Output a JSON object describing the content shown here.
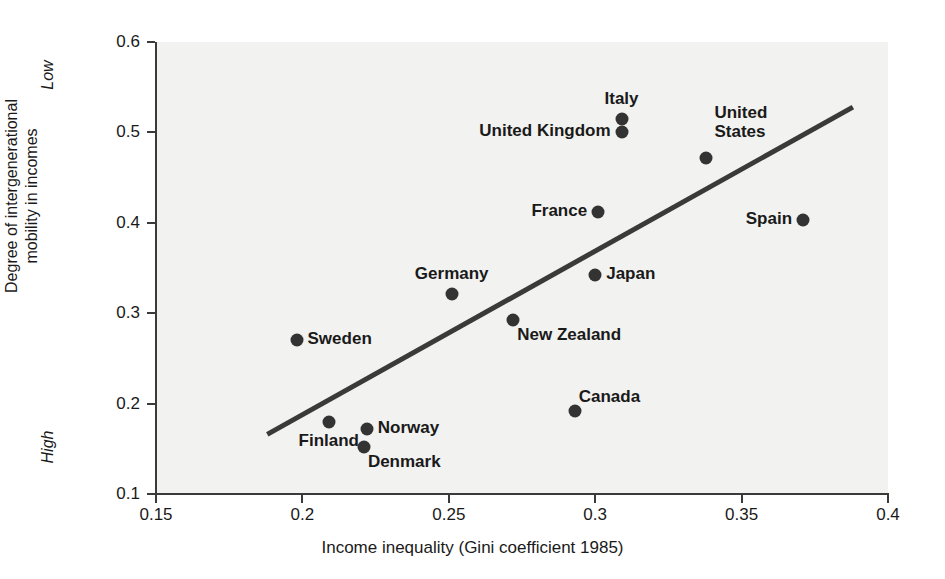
{
  "chart_data": {
    "type": "scatter",
    "title": "",
    "xlabel": "Income inequality (Gini coefficient 1985)",
    "ylabel": "Degree of intergenerational\nmobility in incomes",
    "ylabel_line1": "Degree of intergenerational",
    "ylabel_line2": "mobility in incomes",
    "xlim": [
      0.15,
      0.4
    ],
    "ylim": [
      0.1,
      0.6
    ],
    "xticks": [
      "0.15",
      "0.2",
      "0.25",
      "0.3",
      "0.35",
      "0.4"
    ],
    "xtick_values": [
      0.15,
      0.2,
      0.25,
      0.3,
      0.35,
      0.4
    ],
    "yticks": [
      "0.1",
      "0.2",
      "0.3",
      "0.4",
      "0.5",
      "0.6"
    ],
    "ytick_values": [
      0.1,
      0.2,
      0.3,
      0.4,
      0.5,
      0.6
    ],
    "grid": false,
    "legend": "none",
    "y_axis_annotations": [
      {
        "text": "Low",
        "value": 0.555,
        "name": "low-annotation"
      },
      {
        "text": "High",
        "value": 0.145,
        "name": "high-annotation"
      }
    ],
    "points": [
      {
        "label": "Sweden",
        "x": 0.198,
        "y": 0.27,
        "label_pos": "right"
      },
      {
        "label": "Finland",
        "x": 0.209,
        "y": 0.18,
        "label_pos": "below"
      },
      {
        "label": "Norway",
        "x": 0.222,
        "y": 0.172,
        "label_pos": "right"
      },
      {
        "label": "Denmark",
        "x": 0.221,
        "y": 0.152,
        "label_pos": "below-right"
      },
      {
        "label": "Germany",
        "x": 0.251,
        "y": 0.321,
        "label_pos": "above"
      },
      {
        "label": "New Zealand",
        "x": 0.272,
        "y": 0.293,
        "label_pos": "below-right"
      },
      {
        "label": "Canada",
        "x": 0.293,
        "y": 0.192,
        "label_pos": "above-right"
      },
      {
        "label": "France",
        "x": 0.301,
        "y": 0.412,
        "label_pos": "left"
      },
      {
        "label": "Japan",
        "x": 0.3,
        "y": 0.342,
        "label_pos": "right"
      },
      {
        "label": "United Kingdom",
        "x": 0.309,
        "y": 0.5,
        "label_pos": "left"
      },
      {
        "label": "Italy",
        "x": 0.309,
        "y": 0.515,
        "label_pos": "above"
      },
      {
        "label": "United States",
        "x": 0.338,
        "y": 0.472,
        "label_pos": "above-right"
      },
      {
        "label": "Spain",
        "x": 0.371,
        "y": 0.403,
        "label_pos": "left"
      }
    ],
    "trendline": {
      "x0": 0.188,
      "y0": 0.166,
      "x1": 0.388,
      "y1": 0.528
    }
  },
  "colors": {
    "plot_background": "#f2f2f0",
    "page_background": "#ffffff",
    "marker": "#333333",
    "trendline": "#3a3a3a",
    "axis": "#3a3a3a",
    "text": "#1a1a1a"
  }
}
